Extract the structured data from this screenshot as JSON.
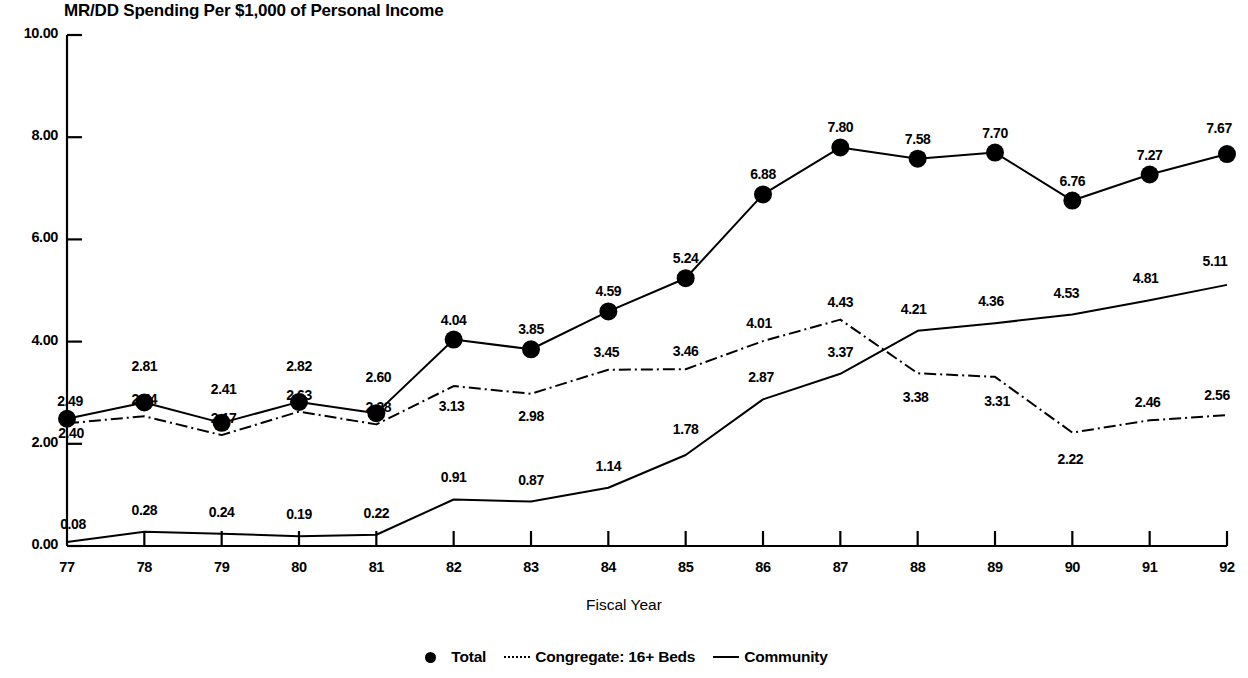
{
  "chart_data": {
    "type": "line",
    "title": "MR/DD Spending Per $1,000 of Personal Income",
    "xlabel": "Fiscal Year",
    "ylabel": "",
    "categories": [
      "77",
      "78",
      "79",
      "80",
      "81",
      "82",
      "83",
      "84",
      "85",
      "86",
      "87",
      "88",
      "89",
      "90",
      "91",
      "92"
    ],
    "x_tick_labels": [
      "77",
      "78",
      "79",
      "80",
      "81",
      "82",
      "83",
      "84",
      "85",
      "86",
      "87",
      "88",
      "89",
      "90",
      "91",
      "92"
    ],
    "y_tick_labels": [
      "0.00",
      "2.00",
      "4.00",
      "6.00",
      "8.00",
      "10.00"
    ],
    "y_tick_values": [
      0,
      2,
      4,
      6,
      8,
      10
    ],
    "ylim": [
      0,
      10
    ],
    "grid": false,
    "legend_position": "bottom",
    "series": [
      {
        "name": "Total",
        "style": "solid-with-markers",
        "values": [
          2.49,
          2.81,
          2.41,
          2.82,
          2.6,
          4.04,
          3.85,
          4.59,
          5.24,
          6.88,
          7.8,
          7.58,
          7.7,
          6.76,
          7.27,
          7.67
        ],
        "labels": [
          "2.49",
          "2.81",
          "2.41",
          "2.82",
          "2.60",
          "4.04",
          "3.85",
          "4.59",
          "5.24",
          "6.88",
          "7.80",
          "7.58",
          "7.70",
          "6.76",
          "7.27",
          "7.67"
        ]
      },
      {
        "name": "Congregate: 16+ Beds",
        "style": "dash-dot",
        "values": [
          2.4,
          2.54,
          2.17,
          2.63,
          2.38,
          3.13,
          2.98,
          3.45,
          3.46,
          4.01,
          4.43,
          3.38,
          3.31,
          2.22,
          2.46,
          2.56
        ],
        "labels": [
          "2.40",
          "2.54",
          "2.17",
          "2.63",
          "2.38",
          "3.13",
          "2.98",
          "3.45",
          "3.46",
          "4.01",
          "4.43",
          "3.38",
          "3.31",
          "2.22",
          "2.46",
          "2.56"
        ]
      },
      {
        "name": "Community",
        "style": "solid",
        "values": [
          0.08,
          0.28,
          0.24,
          0.19,
          0.22,
          0.91,
          0.87,
          1.14,
          1.78,
          2.87,
          3.37,
          4.21,
          4.36,
          4.53,
          4.81,
          5.11
        ],
        "labels": [
          "0.08",
          "0.28",
          "0.24",
          "0.19",
          "0.22",
          "0.91",
          "0.87",
          "1.14",
          "1.78",
          "2.87",
          "3.37",
          "4.21",
          "4.36",
          "4.53",
          "4.81",
          "5.11"
        ]
      }
    ]
  },
  "legend": {
    "items": [
      {
        "label": "Total",
        "swatch": "marker"
      },
      {
        "label": "Congregate: 16+ Beds",
        "swatch": "dashdot"
      },
      {
        "label": "Community",
        "swatch": "solid"
      }
    ]
  },
  "colors": {
    "ink": "#000000",
    "background": "#ffffff"
  }
}
